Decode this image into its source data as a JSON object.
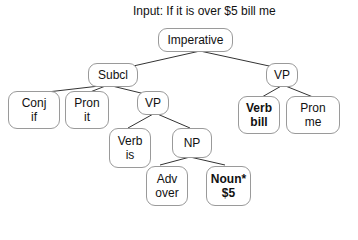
{
  "title": "Input: If it is over $5 bill me",
  "nodes": {
    "imperative": {
      "label": "Imperative",
      "word": ""
    },
    "subcl": {
      "label": "Subcl",
      "word": ""
    },
    "vp_root": {
      "label": "VP",
      "word": ""
    },
    "conj": {
      "label": "Conj",
      "word": "if"
    },
    "pron_it": {
      "label": "Pron",
      "word": "it"
    },
    "vp_sub": {
      "label": "VP",
      "word": ""
    },
    "verb_bill": {
      "label": "Verb",
      "word": "bill"
    },
    "pron_me": {
      "label": "Pron",
      "word": "me"
    },
    "verb_is": {
      "label": "Verb",
      "word": "is"
    },
    "np": {
      "label": "NP",
      "word": ""
    },
    "adv": {
      "label": "Adv",
      "word": "over"
    },
    "noun": {
      "label": "Noun*",
      "word": "$5"
    }
  },
  "edges": [
    [
      "imperative",
      "subcl"
    ],
    [
      "imperative",
      "vp_root"
    ],
    [
      "subcl",
      "conj"
    ],
    [
      "subcl",
      "pron_it"
    ],
    [
      "subcl",
      "vp_sub"
    ],
    [
      "vp_root",
      "verb_bill"
    ],
    [
      "vp_root",
      "pron_me"
    ],
    [
      "vp_sub",
      "verb_is"
    ],
    [
      "vp_sub",
      "np"
    ],
    [
      "np",
      "adv"
    ],
    [
      "np",
      "noun"
    ]
  ],
  "colors": {
    "line": "#333333",
    "border": "#9a9a9a",
    "text": "#111111"
  }
}
